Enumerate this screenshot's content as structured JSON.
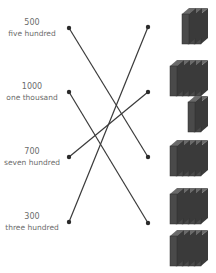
{
  "exercise": {
    "type": "matching",
    "left_items": [
      {
        "number": "500",
        "words": "five hundred",
        "y": 28
      },
      {
        "number": "1000",
        "words": "one thousand",
        "y": 92
      },
      {
        "number": "700",
        "words": "seven hundred",
        "y": 157
      },
      {
        "number": "300",
        "words": "three hundred",
        "y": 222
      }
    ],
    "right_groups": [
      {
        "value": 300,
        "hundreds_plates": [
          3
        ],
        "dot_y": 27
      },
      {
        "value": 700,
        "hundreds_plates": [
          5,
          2
        ],
        "dot_y": 92
      },
      {
        "value": 500,
        "hundreds_plates": [
          5
        ],
        "dot_y": 157
      },
      {
        "value": 1000,
        "hundreds_plates": [
          5,
          5
        ],
        "dot_y": 223
      }
    ],
    "connections": [
      {
        "from": "500",
        "to_group": 2
      },
      {
        "from": "1000",
        "to_group": 3
      },
      {
        "from": "700",
        "to_group": 1
      },
      {
        "from": "300",
        "to_group": 0
      }
    ],
    "colors": {
      "line": "#3a3a3a",
      "dot": "#2a2a2a",
      "plate_front": "#4a4a4a",
      "plate_side": "#3a3a3a",
      "plate_top": "#6a6a6a",
      "text": "#6b6b6b"
    }
  }
}
